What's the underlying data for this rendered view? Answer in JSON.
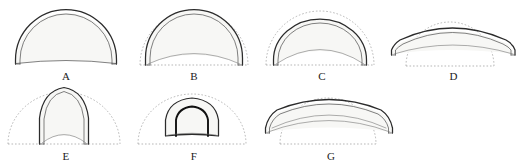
{
  "plate": {
    "background_color": "#ffffff",
    "line_color": "#2b2b2b",
    "inner_line_color": "#4a4a4a",
    "guide_color": "#9a9a9a",
    "fill_color": "#f7f7f5",
    "heavy_line_color": "#111111",
    "figure_count": 7
  },
  "figures": [
    {
      "label": "A",
      "description": "semicircular arch profile, double outline, flat slightly-cambered springing line, no dotted reference arc",
      "has_guide_arc": false,
      "has_guide_baseline": false,
      "profile": "semicircular",
      "span_px": 112,
      "rise_px": 56
    },
    {
      "label": "B",
      "description": "segmental-to-semicircular arch inscribed within dotted semicircular reference, inner soffit curve rising at the crown",
      "has_guide_arc": true,
      "has_guide_baseline": true,
      "profile": "slightly-stilted round",
      "span_px": 104,
      "rise_px": 52
    },
    {
      "label": "C",
      "description": "flattened round arch set inside dotted semicircular reference, deep inner soffit curve",
      "has_guide_arc": true,
      "has_guide_baseline": true,
      "profile": "depressed round",
      "span_px": 104,
      "rise_px": 48
    },
    {
      "label": "D",
      "description": "shallow segmental arch spanning wider than the dotted semicircular reference, very low rise",
      "has_guide_arc": true,
      "has_guide_baseline": true,
      "profile": "segmental",
      "span_px": 126,
      "rise_px": 30
    },
    {
      "label": "E",
      "description": "tall narrow pointed lancet arch rising above the dotted semicircular reference",
      "has_guide_arc": true,
      "has_guide_baseline": true,
      "profile": "pointed lancet",
      "span_px": 52,
      "rise_px": 62
    },
    {
      "label": "F",
      "description": "small stilted horseshoe arch with heavy inner outline, much smaller than the dotted semicircular reference",
      "has_guide_arc": true,
      "has_guide_baseline": true,
      "profile": "stilted horseshoe",
      "span_px": 50,
      "rise_px": 38
    },
    {
      "label": "G",
      "description": "very wide flat segmental arch spanning well beyond the dotted semicircular reference",
      "has_guide_arc": true,
      "has_guide_baseline": true,
      "profile": "flat segmental",
      "span_px": 134,
      "rise_px": 32
    }
  ]
}
